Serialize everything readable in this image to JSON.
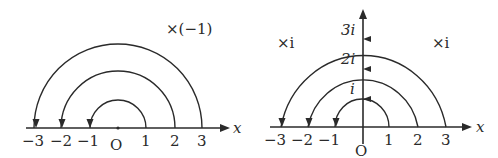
{
  "left_diagram": {
    "operation_label": "×(−1)",
    "axis_label": "x",
    "origin_label": "O",
    "ticks": [
      "−3",
      "−2",
      "−1",
      "1",
      "2",
      "3"
    ],
    "arcs": [
      {
        "from": "1",
        "to": "−1"
      },
      {
        "from": "2",
        "to": "−2"
      },
      {
        "from": "3",
        "to": "−3"
      }
    ]
  },
  "right_diagram": {
    "operation_label_left": "×i",
    "operation_label_right": "×i",
    "axis_label": "x",
    "origin_label": "O",
    "ticks": [
      "−3",
      "−2",
      "−1",
      "1",
      "2",
      "3"
    ],
    "imag_labels": [
      "i",
      "2i",
      "3i"
    ],
    "arcs": [
      {
        "from": "1",
        "via": "i",
        "to": "−1"
      },
      {
        "from": "2",
        "via": "2i",
        "to": "−2"
      },
      {
        "from": "3",
        "via": "3i",
        "to": "−3"
      }
    ]
  },
  "colors": {
    "ink": "#2a2a2a",
    "background": "#ffffff"
  }
}
